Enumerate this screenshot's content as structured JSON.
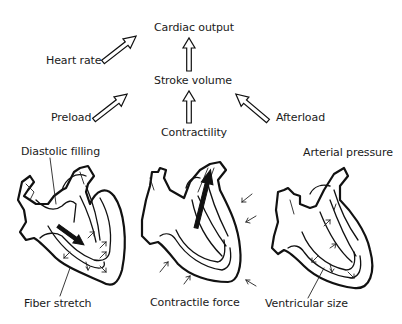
{
  "diagram": {
    "title_node": "Cardiac output",
    "nodes": {
      "cardiac_output": "Cardiac output",
      "heart_rate": "Heart rate",
      "stroke_volume": "Stroke volume",
      "preload": "Preload",
      "contractility": "Contractility",
      "afterload": "Afterload"
    },
    "edges": [
      {
        "from": "Heart rate",
        "to": "Cardiac output"
      },
      {
        "from": "Stroke volume",
        "to": "Cardiac output"
      },
      {
        "from": "Preload",
        "to": "Stroke volume"
      },
      {
        "from": "Contractility",
        "to": "Stroke volume"
      },
      {
        "from": "Afterload",
        "to": "Stroke volume"
      }
    ],
    "hearts": [
      {
        "top_label": "Diastolic filling",
        "bottom_label": "Fiber stretch"
      },
      {
        "top_label": "",
        "bottom_label": "Contractile force"
      },
      {
        "top_label": "Arterial pressure",
        "bottom_label": "Ventricular size"
      }
    ]
  }
}
